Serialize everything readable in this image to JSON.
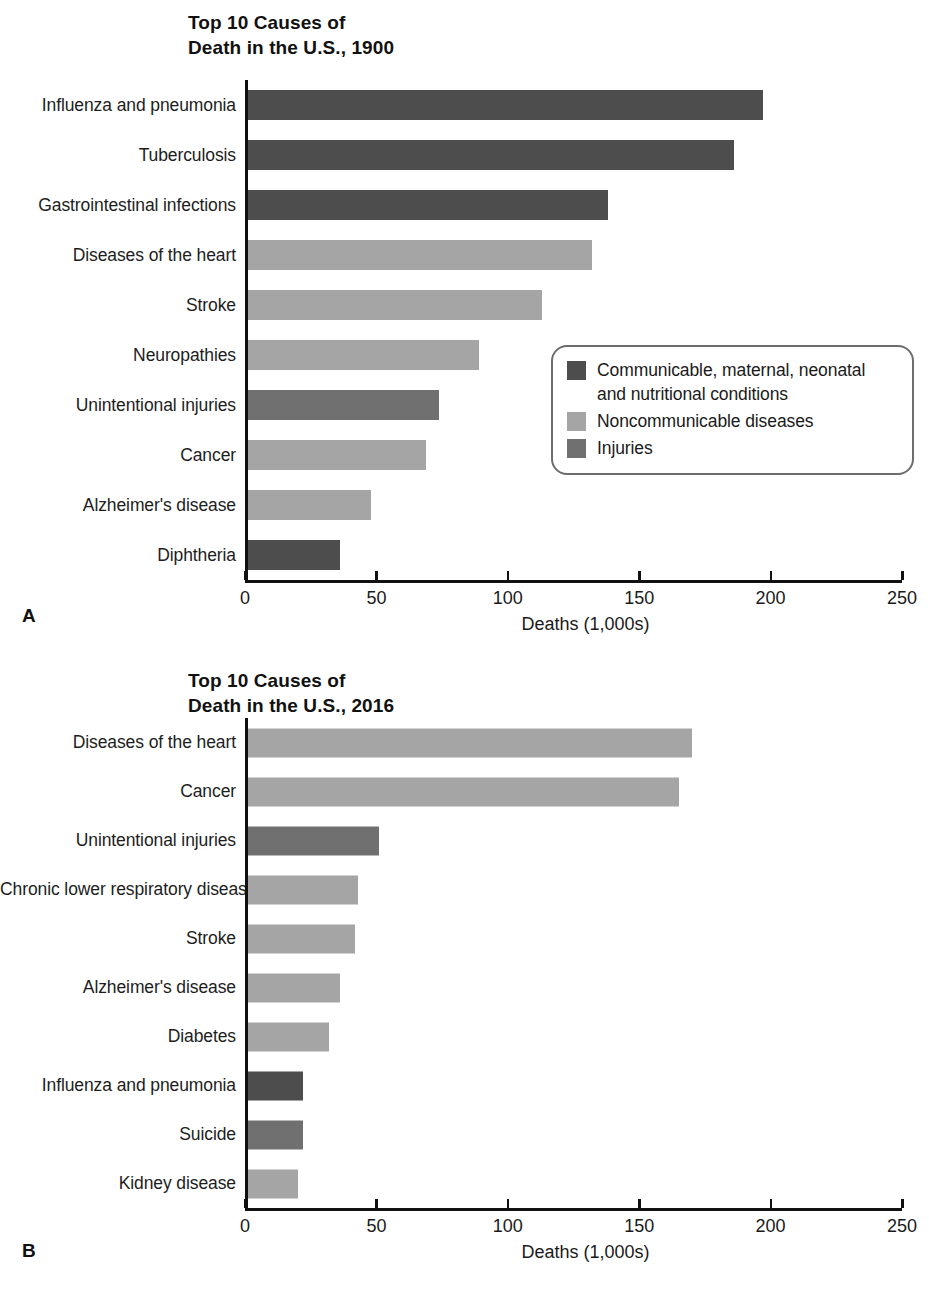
{
  "figure": {
    "axis_title": "Deaths (1,000s)",
    "ticks": [
      "0",
      "50",
      "100",
      "150",
      "200",
      "250"
    ],
    "panel_a_letter": "A",
    "panel_b_letter": "B",
    "colors": {
      "communicable": "#4d4d4d",
      "noncommunicable": "#a5a5a5",
      "injuries": "#707070",
      "axis": "#111111",
      "legend_border": "#6d6d6d",
      "background": "#ffffff"
    }
  },
  "legend": {
    "items": [
      {
        "label": "Communicable, maternal, neonatal\nand nutritional conditions",
        "key": "communicable"
      },
      {
        "label": "Noncommunicable diseases",
        "key": "noncommunicable"
      },
      {
        "label": "Injuries",
        "key": "injuries"
      }
    ]
  },
  "chart_data": [
    {
      "type": "bar",
      "orientation": "horizontal",
      "title": "Top 10 Causes of\nDeath in the U.S., 1900",
      "panel": "A",
      "xlabel": "Deaths (1,000s)",
      "ylabel": "",
      "xlim": [
        0,
        250
      ],
      "xticks": [
        0,
        50,
        100,
        150,
        200,
        250
      ],
      "grid": false,
      "legend_position": "center-right",
      "categories": [
        "Influenza and pneumonia",
        "Tuberculosis",
        "Gastrointestinal infections",
        "Diseases of the heart",
        "Stroke",
        "Neuropathies",
        "Unintentional injuries",
        "Cancer",
        "Alzheimer's disease",
        "Diphtheria"
      ],
      "values": [
        197,
        186,
        138,
        132,
        113,
        89,
        74,
        69,
        48,
        36
      ],
      "groups": [
        "communicable",
        "communicable",
        "communicable",
        "noncommunicable",
        "noncommunicable",
        "noncommunicable",
        "injuries",
        "noncommunicable",
        "noncommunicable",
        "communicable"
      ]
    },
    {
      "type": "bar",
      "orientation": "horizontal",
      "title": "Top 10 Causes of\nDeath in the U.S., 2016",
      "panel": "B",
      "xlabel": "Deaths (1,000s)",
      "ylabel": "",
      "xlim": [
        0,
        250
      ],
      "xticks": [
        0,
        50,
        100,
        150,
        200,
        250
      ],
      "grid": false,
      "legend_position": "center-right",
      "categories": [
        "Diseases of the heart",
        "Cancer",
        "Unintentional injuries",
        "Chronic lower respiratory disease",
        "Stroke",
        "Alzheimer's disease",
        "Diabetes",
        "Influenza and pneumonia",
        "Suicide",
        "Kidney disease"
      ],
      "values": [
        170,
        165,
        51,
        43,
        42,
        36,
        32,
        22,
        22,
        20
      ],
      "groups": [
        "noncommunicable",
        "noncommunicable",
        "injuries",
        "noncommunicable",
        "noncommunicable",
        "noncommunicable",
        "noncommunicable",
        "communicable",
        "injuries",
        "noncommunicable"
      ]
    }
  ]
}
